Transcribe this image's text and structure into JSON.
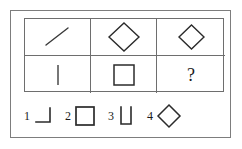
{
  "puzzle": {
    "type": "visual-analogy-matrix",
    "frame": {
      "border_color": "#7d7d7d"
    },
    "grid": {
      "border_color": "#6e6e6e",
      "rows": 2,
      "columns": 3,
      "cells": [
        {
          "position": "r1c1",
          "shape": "diagonal-line",
          "label": "/"
        },
        {
          "position": "r1c2",
          "shape": "diamond-large",
          "label": "◇"
        },
        {
          "position": "r1c3",
          "shape": "diamond-small",
          "label": "◇"
        },
        {
          "position": "r2c1",
          "shape": "vertical-line",
          "label": "|"
        },
        {
          "position": "r2c2",
          "shape": "square",
          "label": "□"
        },
        {
          "position": "r2c3",
          "shape": "question-mark",
          "label": "?"
        }
      ]
    },
    "options": [
      {
        "number": "1",
        "shape": "right-angle-corner",
        "label": "┐"
      },
      {
        "number": "2",
        "shape": "square",
        "label": "□"
      },
      {
        "number": "3",
        "shape": "u-shape",
        "label": "∪"
      },
      {
        "number": "4",
        "shape": "diamond",
        "label": "◇"
      }
    ]
  },
  "colors": {
    "ink": "#1a1a1a",
    "line": "#4a4a4a",
    "grid": "#6e6e6e",
    "frame": "#7d7d7d",
    "background": "#ffffff"
  }
}
